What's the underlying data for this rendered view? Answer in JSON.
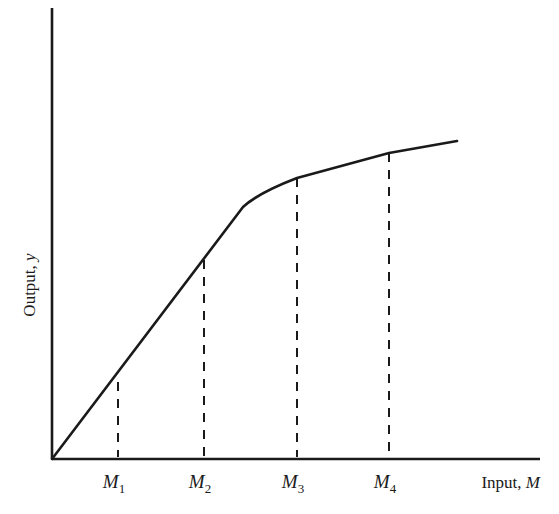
{
  "chart_data": {
    "type": "line",
    "title": "",
    "xlabel": "Input, M",
    "xlabel_parts": {
      "text": "Input, ",
      "var": "M"
    },
    "ylabel": "Output, y",
    "ylabel_parts": {
      "text": "Output, ",
      "var": "y"
    },
    "grid": false,
    "legend": null,
    "x_ticks": [
      {
        "label": "M1",
        "base": "M",
        "sub": "1",
        "x": 118
      },
      {
        "label": "M2",
        "base": "M",
        "sub": "2",
        "x": 204
      },
      {
        "label": "M3",
        "base": "M",
        "sub": "3",
        "x": 297
      },
      {
        "label": "M4",
        "base": "M",
        "sub": "4",
        "x": 389
      }
    ],
    "series": [
      {
        "name": "Production function",
        "description": "Linear (constant returns) from origin up to a kink just past M2, then concave with diminishing returns through M3 and M4",
        "points_px": [
          [
            52,
            459
          ],
          [
            118,
            382
          ],
          [
            204,
            260
          ],
          [
            243,
            207
          ],
          [
            258,
            195
          ],
          [
            297,
            178
          ],
          [
            389,
            153
          ],
          [
            457,
            141
          ]
        ]
      }
    ],
    "dashed_lines": [
      {
        "label": "M1",
        "x": 118,
        "y_top": 382,
        "y_bottom": 459
      },
      {
        "label": "M2",
        "x": 204,
        "y_top": 260,
        "y_bottom": 459
      },
      {
        "label": "M3",
        "x": 297,
        "y_top": 178,
        "y_bottom": 459
      },
      {
        "label": "M4",
        "x": 389,
        "y_top": 153,
        "y_bottom": 459
      }
    ],
    "axes": {
      "origin": [
        52,
        459
      ],
      "y_axis_top": 8,
      "x_axis_right": 540
    },
    "colors": {
      "line": "#1a1a1a",
      "background": "#ffffff"
    }
  }
}
